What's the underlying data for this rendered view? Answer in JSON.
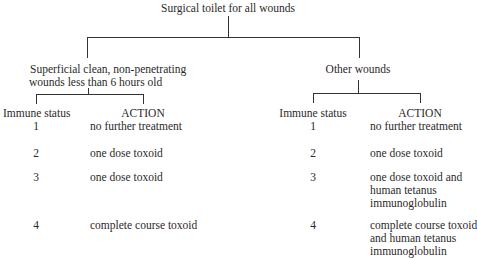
{
  "root": {
    "label": "Surgical toilet for all wounds"
  },
  "branches": [
    {
      "label_lines": [
        "Superficial clean, non-penetrating",
        "wounds less than 6 hours old"
      ],
      "header_status": "Immune status",
      "header_action": "ACTION",
      "rows": [
        {
          "status": "1",
          "action": "no further treatment"
        },
        {
          "status": "2",
          "action": "one dose toxoid"
        },
        {
          "status": "3",
          "action": "one dose toxoid"
        },
        {
          "status": "4",
          "action": "complete course toxoid"
        }
      ]
    },
    {
      "label_lines": [
        "Other wounds"
      ],
      "header_status": "Immune status",
      "header_action": "ACTION",
      "rows": [
        {
          "status": "1",
          "action": "no further treatment"
        },
        {
          "status": "2",
          "action": "one dose toxoid"
        },
        {
          "status": "3",
          "action_lines": [
            "one dose toxoid and",
            "human tetanus",
            "immunoglobulin"
          ]
        },
        {
          "status": "4",
          "action_lines": [
            "complete course toxoid",
            "and human tetanus",
            "immunoglobulin"
          ]
        }
      ]
    }
  ],
  "colors": {
    "line": "#333333",
    "text": "#2a2a2a"
  }
}
